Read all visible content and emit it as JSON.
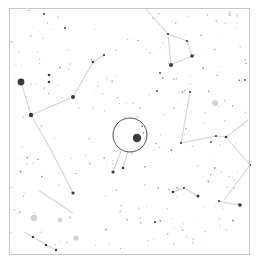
{
  "map": {
    "type": "star-chart",
    "background": "#ffffff",
    "border_color": "#c8c8c8",
    "line_color": "#d4d4d4",
    "star_color": "#3a3a3a",
    "faint_star_color": "#b4b4b4",
    "nebula_color": "#c6c6c6",
    "frame": {
      "x": 9,
      "y": 8,
      "w": 240,
      "h": 246
    },
    "highlight_circle": {
      "cx": 130,
      "cy": 135,
      "r": 17,
      "color": "#505050"
    },
    "constellation_lines": [
      [
        [
          21,
          82
        ],
        [
          31,
          115
        ]
      ],
      [
        [
          31,
          115
        ],
        [
          73,
          97
        ]
      ],
      [
        [
          73,
          97
        ],
        [
          93,
          62
        ]
      ],
      [
        [
          93,
          62
        ],
        [
          104,
          55
        ]
      ],
      [
        [
          31,
          115
        ],
        [
          51,
          150
        ]
      ],
      [
        [
          51,
          150
        ],
        [
          73,
          193
        ]
      ],
      [
        [
          38,
          190
        ],
        [
          73,
          213
        ]
      ],
      [
        [
          24,
          232
        ],
        [
          33,
          237
        ]
      ],
      [
        [
          33,
          237
        ],
        [
          46,
          245
        ]
      ],
      [
        [
          46,
          245
        ],
        [
          56,
          250
        ]
      ],
      [
        [
          145,
          8
        ],
        [
          168,
          34
        ]
      ],
      [
        [
          168,
          34
        ],
        [
          187,
          41
        ]
      ],
      [
        [
          187,
          41
        ],
        [
          192,
          56
        ]
      ],
      [
        [
          192,
          56
        ],
        [
          171,
          65
        ]
      ],
      [
        [
          171,
          65
        ],
        [
          168,
          34
        ]
      ],
      [
        [
          190,
          92
        ],
        [
          181,
          143
        ]
      ],
      [
        [
          181,
          143
        ],
        [
          216,
          136
        ]
      ],
      [
        [
          216,
          136
        ],
        [
          226,
          137
        ]
      ],
      [
        [
          226,
          137
        ],
        [
          248,
          120
        ]
      ],
      [
        [
          226,
          137
        ],
        [
          250,
          165
        ]
      ],
      [
        [
          250,
          165
        ],
        [
          224,
          200
        ]
      ],
      [
        [
          219,
          201
        ],
        [
          233,
          204
        ]
      ],
      [
        [
          233,
          204
        ],
        [
          240,
          205
        ]
      ],
      [
        [
          173,
          192
        ],
        [
          184,
          188
        ]
      ],
      [
        [
          184,
          188
        ],
        [
          198,
          196
        ]
      ],
      [
        [
          121,
          151
        ],
        [
          113,
          172
        ]
      ],
      [
        [
          128,
          151
        ],
        [
          123,
          168
        ]
      ]
    ],
    "bright_stars": [
      {
        "x": 21,
        "y": 82,
        "r": 3.4
      },
      {
        "x": 137,
        "y": 138,
        "r": 4.2
      },
      {
        "x": 31,
        "y": 115,
        "r": 2.2
      },
      {
        "x": 73,
        "y": 97,
        "r": 2.0
      },
      {
        "x": 171,
        "y": 65,
        "r": 2.0
      },
      {
        "x": 192,
        "y": 56,
        "r": 1.8
      },
      {
        "x": 240,
        "y": 205,
        "r": 1.8
      },
      {
        "x": 73,
        "y": 193,
        "r": 1.6
      },
      {
        "x": 113,
        "y": 172,
        "r": 1.6
      },
      {
        "x": 198,
        "y": 196,
        "r": 1.5
      },
      {
        "x": 49,
        "y": 75,
        "r": 1.3
      },
      {
        "x": 49,
        "y": 82,
        "r": 1.3
      },
      {
        "x": 93,
        "y": 62,
        "r": 1.2
      },
      {
        "x": 104,
        "y": 55,
        "r": 1.1
      },
      {
        "x": 168,
        "y": 34,
        "r": 1.1
      },
      {
        "x": 187,
        "y": 41,
        "r": 1.1
      },
      {
        "x": 190,
        "y": 92,
        "r": 1.1
      },
      {
        "x": 181,
        "y": 143,
        "r": 1.1
      },
      {
        "x": 216,
        "y": 136,
        "r": 1.1
      },
      {
        "x": 226,
        "y": 137,
        "r": 1.3
      },
      {
        "x": 250,
        "y": 165,
        "r": 1.1
      },
      {
        "x": 173,
        "y": 192,
        "r": 1.3
      },
      {
        "x": 184,
        "y": 188,
        "r": 1.1
      },
      {
        "x": 219,
        "y": 201,
        "r": 1.1
      },
      {
        "x": 33,
        "y": 237,
        "r": 1.2
      },
      {
        "x": 46,
        "y": 245,
        "r": 1.2
      },
      {
        "x": 56,
        "y": 250,
        "r": 1.2
      },
      {
        "x": 123,
        "y": 168,
        "r": 1.3
      },
      {
        "x": 44,
        "y": 14,
        "r": 1.0
      },
      {
        "x": 65,
        "y": 28,
        "r": 0.9
      },
      {
        "x": 160,
        "y": 73,
        "r": 0.9
      },
      {
        "x": 155,
        "y": 222,
        "r": 1.1
      },
      {
        "x": 211,
        "y": 142,
        "r": 0.9
      },
      {
        "x": 245,
        "y": 80,
        "r": 0.9
      },
      {
        "x": 157,
        "y": 91,
        "r": 0.9
      }
    ],
    "nebulae": [
      {
        "x": 215,
        "y": 103,
        "r": 3.0
      },
      {
        "x": 34,
        "y": 218,
        "r": 3.2
      },
      {
        "x": 76,
        "y": 238,
        "r": 2.6
      },
      {
        "x": 60,
        "y": 220,
        "r": 2.2
      }
    ],
    "faint_star_seed": 7,
    "faint_star_count": 260
  }
}
